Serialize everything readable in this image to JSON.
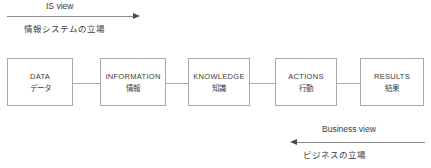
{
  "diagram": {
    "title_top": {
      "en": "IS view",
      "ja": "情報システムの立場"
    },
    "title_bottom": {
      "en": "Business view",
      "ja": "ビジネスの立場"
    },
    "nodes": [
      {
        "en": "DATA",
        "ja": "データ"
      },
      {
        "en": "INFORMATION",
        "ja": "情報"
      },
      {
        "en": "KNOWLEDGE",
        "ja": "知識"
      },
      {
        "en": "ACTIONS",
        "ja": "行動"
      },
      {
        "en": "RESULTS",
        "ja": "結果"
      }
    ],
    "arrows": [
      {
        "name": "is-view-arrow",
        "direction": "right"
      },
      {
        "name": "business-view-arrow",
        "direction": "left"
      }
    ],
    "colors": {
      "box_border": "#a9a9a9",
      "text": "#3a3a3a",
      "arrow": "#8c8c8c",
      "arrow_head": "#4a4a4a",
      "background": "#ffffff"
    }
  }
}
